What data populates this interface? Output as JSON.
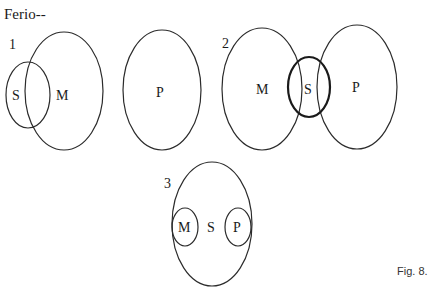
{
  "title": "Ferio--",
  "caption": "Fig. 8.",
  "colors": {
    "stroke": "#2b2b2b",
    "background": "#ffffff"
  },
  "diagrams": [
    {
      "number": "1",
      "sets": [
        {
          "label": "S",
          "relation": "partially overlaps M"
        },
        {
          "label": "M"
        },
        {
          "label": "P",
          "relation": "disjoint from M"
        }
      ]
    },
    {
      "number": "2",
      "sets": [
        {
          "label": "M"
        },
        {
          "label": "S",
          "relation": "overlaps M and P (bold)"
        },
        {
          "label": "P"
        }
      ]
    },
    {
      "number": "3",
      "sets": [
        {
          "label": "M",
          "relation": "inside S"
        },
        {
          "label": "S"
        },
        {
          "label": "P",
          "relation": "inside S"
        }
      ]
    }
  ]
}
